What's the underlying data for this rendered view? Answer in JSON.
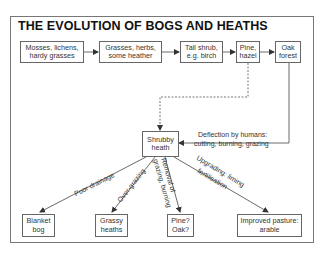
{
  "title": "THE EVOLUTION OF BOGS AND HEATHS",
  "succession": [
    {
      "line1": "Mosses, lichens,",
      "line2": "hardy grasses"
    },
    {
      "line1": "Grasses, herbs,",
      "line2": "some heather"
    },
    {
      "line1": "Tall shrub,",
      "line2": "e.g. birch"
    },
    {
      "line1": "Pine,",
      "line2": "hazel"
    },
    {
      "line1": "Oak",
      "line2": "forest"
    }
  ],
  "center": {
    "line1": "Shrubby",
    "line2": "heath"
  },
  "deflection": {
    "line1": "Deflection by humans:",
    "line2": "cutting, burning, grazing"
  },
  "outcomes": [
    {
      "line1": "Blanket",
      "line2": "bog",
      "cause": "Poor drainage"
    },
    {
      "line1": "Grassy",
      "line2": "heaths",
      "cause": "Over-grazing"
    },
    {
      "line1": "Pine?",
      "line2": "Oak?",
      "cause_line1": "Removal of",
      "cause_line2": "grazing, burning"
    },
    {
      "line1": "Improved pasture:",
      "line2": "arable",
      "cause_line1": "Upgrading: liming",
      "cause_line2": "fertilisation"
    }
  ],
  "colors": {
    "line": "#444444",
    "border": "#666666",
    "text": "#333333"
  }
}
